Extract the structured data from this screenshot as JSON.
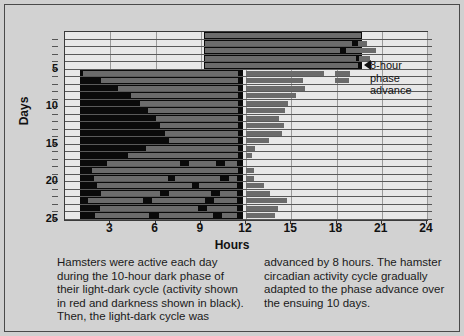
{
  "figure": {
    "xlabel": "Hours",
    "ylabel": "Days"
  },
  "annotation": {
    "line1": "8-hour",
    "line2": "phase",
    "line3": "advance"
  },
  "caption": {
    "left": [
      "Hamsters were active each day",
      "during the 10-hour dark phase of",
      "their light-dark cycle (activity shown",
      "in red and darkness shown in black).",
      "Then, the light-dark cycle was"
    ],
    "right": [
      "advanced by 8 hours. The hamster",
      "circadian activity cycle gradually",
      "adapted to the phase advance over",
      "the ensuing 10 days."
    ]
  },
  "chart_data": {
    "type": "bar",
    "title": "",
    "xlabel": "Hours",
    "ylabel": "Days",
    "xlim": [
      0,
      24
    ],
    "ylim": [
      0,
      25
    ],
    "xticks": [
      3,
      6,
      9,
      12,
      15,
      18,
      21,
      24
    ],
    "yticks": [
      5,
      10,
      15,
      20,
      25
    ],
    "grid": true,
    "legend": [
      {
        "label": "activity",
        "color": "#6b6b6b"
      },
      {
        "label": "darkness",
        "color": "#0a0a0a"
      }
    ],
    "dark_phase_before_shift": {
      "start_hour": 9.2,
      "end_hour": 19.7,
      "days": [
        1,
        5
      ]
    },
    "dark_phase_after_shift": {
      "start_hour": 1.0,
      "end_hour": 11.8,
      "days": [
        6,
        25
      ]
    },
    "rows": [
      {
        "day": 1,
        "activity": [
          [
            9.3,
            19.6
          ]
        ]
      },
      {
        "day": 2,
        "activity": [
          [
            9.3,
            19.0
          ],
          [
            19.4,
            20.0
          ]
        ]
      },
      {
        "day": 3,
        "activity": [
          [
            9.3,
            18.2
          ],
          [
            18.6,
            20.6
          ]
        ]
      },
      {
        "day": 4,
        "activity": [
          [
            9.3,
            19.3
          ],
          [
            19.5,
            20.2
          ]
        ]
      },
      {
        "day": 5,
        "activity": [
          [
            9.3,
            19.4
          ]
        ]
      },
      {
        "day": 6,
        "activity": [
          [
            1.2,
            11.5
          ],
          [
            12.0,
            17.2
          ],
          [
            17.9,
            18.9
          ]
        ]
      },
      {
        "day": 7,
        "activity": [
          [
            2.4,
            11.5
          ],
          [
            12.0,
            15.8
          ],
          [
            17.9,
            18.8
          ]
        ]
      },
      {
        "day": 8,
        "activity": [
          [
            3.5,
            11.5
          ],
          [
            12.0,
            15.9
          ]
        ]
      },
      {
        "day": 9,
        "activity": [
          [
            4.4,
            11.5
          ],
          [
            12.0,
            15.3
          ]
        ]
      },
      {
        "day": 10,
        "activity": [
          [
            5.0,
            11.5
          ],
          [
            12.0,
            14.8
          ]
        ]
      },
      {
        "day": 11,
        "activity": [
          [
            5.5,
            11.5
          ],
          [
            12.0,
            14.6
          ]
        ]
      },
      {
        "day": 12,
        "activity": [
          [
            6.0,
            11.5
          ],
          [
            12.0,
            14.2
          ]
        ]
      },
      {
        "day": 13,
        "activity": [
          [
            6.3,
            11.5
          ],
          [
            12.0,
            14.5
          ]
        ]
      },
      {
        "day": 14,
        "activity": [
          [
            6.6,
            11.5
          ],
          [
            12.0,
            14.4
          ]
        ]
      },
      {
        "day": 15,
        "activity": [
          [
            6.9,
            11.5
          ],
          [
            12.0,
            13.5
          ]
        ]
      },
      {
        "day": 16,
        "activity": [
          [
            5.4,
            11.5
          ],
          [
            12.0,
            12.6
          ]
        ]
      },
      {
        "day": 17,
        "activity": [
          [
            4.2,
            11.5
          ],
          [
            12.0,
            12.4
          ]
        ]
      },
      {
        "day": 18,
        "activity": [
          [
            2.8,
            7.6
          ],
          [
            8.2,
            10.0
          ],
          [
            10.6,
            11.4
          ]
        ]
      },
      {
        "day": 19,
        "activity": [
          [
            1.8,
            11.5
          ],
          [
            12.0,
            12.5
          ]
        ]
      },
      {
        "day": 20,
        "activity": [
          [
            1.9,
            6.8
          ],
          [
            7.3,
            10.3
          ],
          [
            10.9,
            11.4
          ],
          [
            12.0,
            12.5
          ]
        ]
      },
      {
        "day": 21,
        "activity": [
          [
            2.1,
            8.4
          ],
          [
            8.9,
            11.4
          ],
          [
            12.0,
            13.2
          ]
        ]
      },
      {
        "day": 22,
        "activity": [
          [
            2.4,
            6.3
          ],
          [
            6.9,
            9.7
          ],
          [
            10.3,
            11.4
          ],
          [
            12.0,
            13.6
          ]
        ]
      },
      {
        "day": 23,
        "activity": [
          [
            1.5,
            5.2
          ],
          [
            5.8,
            9.3
          ],
          [
            9.9,
            11.4
          ],
          [
            12.0,
            14.7
          ]
        ]
      },
      {
        "day": 24,
        "activity": [
          [
            2.3,
            8.8
          ],
          [
            9.4,
            11.4
          ],
          [
            12.0,
            14.1
          ]
        ]
      },
      {
        "day": 25,
        "activity": [
          [
            2.0,
            5.6
          ],
          [
            6.2,
            9.8
          ],
          [
            10.4,
            11.4
          ],
          [
            12.0,
            13.9
          ]
        ]
      }
    ]
  }
}
